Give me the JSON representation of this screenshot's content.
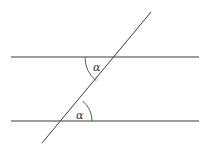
{
  "diagram": {
    "type": "geometry",
    "parallel_lines": [
      "upper-line",
      "lower-line"
    ],
    "transversal": "transversal-line",
    "angles": [
      {
        "id": "upper-angle",
        "label": "α"
      },
      {
        "id": "lower-angle",
        "label": "α"
      }
    ],
    "colors": {
      "stroke": "#3a3a3a",
      "text": "#333333",
      "background": "#ffffff"
    }
  }
}
